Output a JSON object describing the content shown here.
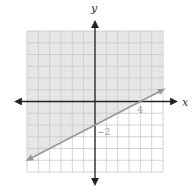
{
  "chart_data": {
    "type": "line",
    "title": "",
    "xlabel": "x",
    "ylabel": "y",
    "xlim": [
      -6,
      6
    ],
    "ylim": [
      -6,
      6
    ],
    "grid": true,
    "grid_step": 1,
    "tick_labels": [
      {
        "text": "4",
        "x": 4,
        "y": 0,
        "axis": "x"
      },
      {
        "text": "-2",
        "x": 0,
        "y": -2,
        "axis": "y"
      }
    ],
    "series": [
      {
        "name": "boundary line y = x/2 - 2",
        "style": "solid",
        "arrows": "both",
        "x": [
          -6,
          0,
          4,
          6
        ],
        "y": [
          -5,
          -2,
          0,
          1
        ]
      }
    ],
    "shaded_region": {
      "description": "region above the line",
      "inequality": "y >= x/2 - 2",
      "color": "#e6e6e6"
    },
    "colors": {
      "shade": "#e6e6e6",
      "grid": "#c8c8c8",
      "axis": "#222222",
      "line": "#999999"
    }
  },
  "axes": {
    "x_label": "x",
    "y_label": "y"
  }
}
